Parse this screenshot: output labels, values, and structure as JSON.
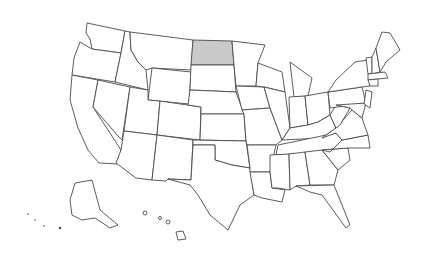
{
  "map": {
    "title": "",
    "highlighted_state": "North Dakota",
    "highlight_color": "#c9c9c9",
    "default_fill": "#ffffff",
    "stroke_color": "#4a4a4a"
  },
  "states": [
    {
      "name": "Washington",
      "d": "M87,23 L125,31 L121,53 L92,49 L90,39 L86,33 Z"
    },
    {
      "name": "Oregon",
      "d": "M80,42 L92,49 L121,53 L115,82 L72,75 L74,58 Z"
    },
    {
      "name": "California",
      "d": "M72,75 L98,80 L93,107 L121,150 L118,164 L99,163 L88,150 L78,128 L70,100 Z"
    },
    {
      "name": "Idaho",
      "d": "M125,31 L130,32 L131,50 L138,62 L146,70 L148,90 L115,82 L121,53 Z"
    },
    {
      "name": "Nevada",
      "d": "M98,80 L130,87 L122,140 L118,136 L93,107 Z"
    },
    {
      "name": "Montana",
      "d": "M130,32 L193,40 L191,70 L152,68 L146,70 L138,62 L131,50 Z"
    },
    {
      "name": "Wyoming",
      "d": "M152,68 L191,72 L189,104 L148,100 Z"
    },
    {
      "name": "Utah",
      "d": "M130,87 L148,90 L148,100 L160,101 L157,135 L124,131 Z"
    },
    {
      "name": "Arizona",
      "d": "M124,131 L157,135 L152,180 L136,178 L116,163 L121,150 Z"
    },
    {
      "name": "Colorado",
      "d": "M160,101 L201,107 L200,140 L157,135 Z"
    },
    {
      "name": "New Mexico",
      "d": "M157,135 L193,140 L191,180 L168,179 L166,181 L152,180 Z"
    },
    {
      "name": "North Dakota",
      "d": "M193,40 L232,41 L234,65 L191,65 Z",
      "highlight": true
    },
    {
      "name": "South Dakota",
      "d": "M191,65 L234,65 L236,92 L190,90 Z"
    },
    {
      "name": "Nebraska",
      "d": "M190,90 L236,92 L244,114 L201,114 L201,107 L188,105 Z"
    },
    {
      "name": "Kansas",
      "d": "M201,114 L244,114 L246,141 L200,140 Z"
    },
    {
      "name": "Oklahoma",
      "d": "M193,140 L246,141 L250,168 L232,165 L215,160 L215,145 L193,145 Z"
    },
    {
      "name": "Texas",
      "d": "M193,145 L215,145 L215,160 L232,165 L250,168 L254,195 L240,205 L228,230 L210,215 L198,195 L190,185 L168,179 L191,180 Z"
    },
    {
      "name": "Minnesota",
      "d": "M232,41 L265,45 L258,63 L256,86 L236,86 L234,65 Z"
    },
    {
      "name": "Iowa",
      "d": "M236,86 L264,87 L270,108 L242,110 Z"
    },
    {
      "name": "Missouri",
      "d": "M242,110 L270,108 L282,140 L276,145 L247,145 L246,141 L244,114 Z"
    },
    {
      "name": "Arkansas",
      "d": "M247,145 L276,145 L270,172 L250,172 L250,168 Z"
    },
    {
      "name": "Louisiana",
      "d": "M250,172 L270,172 L272,188 L285,190 L282,202 L262,198 L254,195 Z"
    },
    {
      "name": "Wisconsin",
      "d": "M258,63 L282,72 L285,92 L264,87 L256,86 Z"
    },
    {
      "name": "Illinois",
      "d": "M264,87 L285,92 L290,128 L282,140 L270,108 Z"
    },
    {
      "name": "Michigan",
      "d": "M290,62 L312,78 L308,96 L294,97 L292,80 Z"
    },
    {
      "name": "Indiana",
      "d": "M289,97 L305,96 L308,125 L290,128 Z"
    },
    {
      "name": "Ohio",
      "d": "M305,96 L328,92 L330,115 L318,122 L308,125 Z"
    },
    {
      "name": "Kentucky",
      "d": "M282,140 L290,128 L308,125 L318,122 L330,115 L336,128 L322,138 Z"
    },
    {
      "name": "Tennessee",
      "d": "M278,145 L336,133 L342,140 L330,152 L276,155 Z"
    },
    {
      "name": "Mississippi",
      "d": "M270,155 L289,154 L290,190 L278,188 L272,188 L270,172 Z"
    },
    {
      "name": "Alabama",
      "d": "M289,154 L305,152 L310,185 L296,186 L290,190 Z"
    },
    {
      "name": "Georgia",
      "d": "M305,152 L322,150 L338,170 L334,185 L310,185 Z"
    },
    {
      "name": "Florida",
      "d": "M296,186 L334,185 L340,200 L350,225 L346,228 L333,210 L322,195 L310,192 Z"
    },
    {
      "name": "South Carolina",
      "d": "M322,150 L348,148 L350,160 L338,170 Z"
    },
    {
      "name": "North Carolina",
      "d": "M330,152 L342,140 L368,135 L370,148 L348,148 L322,150 Z"
    },
    {
      "name": "Virginia",
      "d": "M322,138 L336,128 L352,110 L362,118 L368,135 L342,140 L336,133 Z"
    },
    {
      "name": "West Virginia",
      "d": "M330,115 L336,105 L350,108 L340,125 L336,128 Z"
    },
    {
      "name": "Pennsylvania",
      "d": "M328,92 L362,87 L366,103 L330,108 Z"
    },
    {
      "name": "New York",
      "d": "M336,80 L355,62 L368,60 L370,86 L362,87 L328,92 Z"
    },
    {
      "name": "Maryland",
      "d": "M336,105 L366,103 L362,118 L352,110 L350,108 Z"
    },
    {
      "name": "New Jersey",
      "d": "M366,90 L372,92 L370,108 L364,104 Z"
    },
    {
      "name": "Vermont",
      "d": "M366,58 L372,57 L372,74 L368,74 Z"
    },
    {
      "name": "New Hampshire",
      "d": "M372,57 L376,48 L380,72 L372,74 Z"
    },
    {
      "name": "Maine",
      "d": "M376,48 L382,32 L390,33 L400,50 L386,62 L380,72 Z"
    },
    {
      "name": "Massachusetts",
      "d": "M368,74 L385,72 L388,78 L368,80 Z"
    },
    {
      "name": "Connecticut",
      "d": "M368,80 L378,79 L378,86 L370,86 Z"
    },
    {
      "name": "Alaska",
      "d": "M75,183 L92,180 L100,210 L118,225 L110,228 L95,218 L82,220 L72,215 L70,200 Z"
    },
    {
      "name": "Hawaii",
      "d": "M176,232 L183,231 L186,239 L178,240 Z"
    }
  ]
}
